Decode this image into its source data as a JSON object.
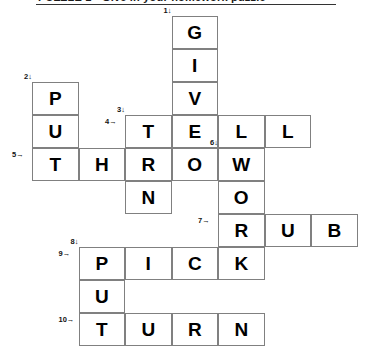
{
  "header": {
    "title": "PUZZLE 1   -   Give in your homework puzzle",
    "clipped": true
  },
  "grid": {
    "origin_x": 32,
    "origin_y": 16,
    "cell_w": 46.5,
    "cell_h": 33,
    "cols": 7,
    "rows": 10
  },
  "cells": [
    {
      "r": 0,
      "c": 3,
      "letter": "G"
    },
    {
      "r": 1,
      "c": 3,
      "letter": "I"
    },
    {
      "r": 2,
      "c": 0,
      "letter": "P"
    },
    {
      "r": 2,
      "c": 3,
      "letter": "V"
    },
    {
      "r": 3,
      "c": 0,
      "letter": "U"
    },
    {
      "r": 3,
      "c": 2,
      "letter": "T"
    },
    {
      "r": 3,
      "c": 3,
      "letter": "E"
    },
    {
      "r": 3,
      "c": 4,
      "letter": "L"
    },
    {
      "r": 3,
      "c": 5,
      "letter": "L"
    },
    {
      "r": 4,
      "c": 0,
      "letter": "T"
    },
    {
      "r": 4,
      "c": 1,
      "letter": "H"
    },
    {
      "r": 4,
      "c": 2,
      "letter": "R"
    },
    {
      "r": 4,
      "c": 3,
      "letter": "O"
    },
    {
      "r": 4,
      "c": 4,
      "letter": "W"
    },
    {
      "r": 5,
      "c": 2,
      "letter": "N"
    },
    {
      "r": 5,
      "c": 4,
      "letter": "O"
    },
    {
      "r": 6,
      "c": 4,
      "letter": "R"
    },
    {
      "r": 6,
      "c": 5,
      "letter": "U"
    },
    {
      "r": 6,
      "c": 6,
      "letter": "B"
    },
    {
      "r": 7,
      "c": 1,
      "letter": "P"
    },
    {
      "r": 7,
      "c": 2,
      "letter": "I"
    },
    {
      "r": 7,
      "c": 3,
      "letter": "C"
    },
    {
      "r": 7,
      "c": 4,
      "letter": "K"
    },
    {
      "r": 8,
      "c": 1,
      "letter": "U"
    },
    {
      "r": 9,
      "c": 1,
      "letter": "T"
    },
    {
      "r": 9,
      "c": 2,
      "letter": "U"
    },
    {
      "r": 9,
      "c": 3,
      "letter": "R"
    },
    {
      "r": 9,
      "c": 4,
      "letter": "N"
    }
  ],
  "clue_numbers": [
    {
      "label": "1↓",
      "r": 0,
      "c": 3,
      "pos": "above-left"
    },
    {
      "label": "2↓",
      "r": 2,
      "c": 0,
      "pos": "above-left"
    },
    {
      "label": "3↓",
      "r": 3,
      "c": 2,
      "pos": "above-left"
    },
    {
      "label": "4→",
      "r": 3,
      "c": 2,
      "pos": "left"
    },
    {
      "label": "5→",
      "r": 4,
      "c": 0,
      "pos": "left"
    },
    {
      "label": "6↓",
      "r": 4,
      "c": 4,
      "pos": "above-left"
    },
    {
      "label": "7→",
      "r": 6,
      "c": 4,
      "pos": "left"
    },
    {
      "label": "8↓",
      "r": 7,
      "c": 1,
      "pos": "above-left"
    },
    {
      "label": "9→",
      "r": 7,
      "c": 1,
      "pos": "left"
    },
    {
      "label": "10→",
      "r": 9,
      "c": 1,
      "pos": "left"
    }
  ],
  "answers": {
    "across": [
      {
        "number": "4",
        "word": "TELL",
        "row": 3,
        "start_col": 2,
        "length": 4
      },
      {
        "number": "5",
        "word": "THROW",
        "row": 4,
        "start_col": 0,
        "length": 5
      },
      {
        "number": "7",
        "word": "RUB",
        "row": 6,
        "start_col": 4,
        "length": 3
      },
      {
        "number": "9",
        "word": "PICK",
        "row": 7,
        "start_col": 1,
        "length": 4
      },
      {
        "number": "10",
        "word": "TURN",
        "row": 9,
        "start_col": 1,
        "length": 4
      }
    ],
    "down": [
      {
        "number": "1",
        "word": "GIVE",
        "col": 3,
        "start_row": 0,
        "length": 4
      },
      {
        "number": "2",
        "word": "PUT",
        "col": 0,
        "start_row": 2,
        "length": 3
      },
      {
        "number": "3",
        "word": "TURN",
        "col": 2,
        "start_row": 3,
        "length": 4
      },
      {
        "number": "6",
        "word": "WORK",
        "col": 4,
        "start_row": 4,
        "length": 4
      },
      {
        "number": "8",
        "word": "PUT",
        "col": 1,
        "start_row": 7,
        "length": 3
      }
    ]
  },
  "colors": {
    "cell_border": "#808080",
    "cell_bg": "#ffffff",
    "letter": "#000000",
    "clue_number": "#111111",
    "rule": "#333333"
  }
}
